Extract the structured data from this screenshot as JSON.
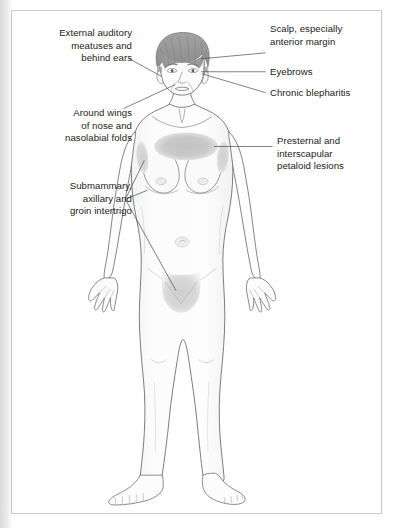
{
  "figure": {
    "colors": {
      "outline": "#6e6e6e",
      "skin_fill": "#fbfbfb",
      "skin_shade": "#f0f0f0",
      "hair": "#9a9a9a",
      "hair_dark": "#8a8a8a",
      "lesion": "#c9c9c9",
      "lesion_soft": "#d6d6d6",
      "leader_line": "#4a4a4a",
      "panel_border": "#c9c9c9",
      "panel_background": "#ffffff",
      "page_background": "#ffffff",
      "text": "#1b1b1b"
    }
  },
  "labels": [
    {
      "id": "external-auditory-meatuses",
      "text": "External auditory\nmeatuses and\nbehind ears",
      "align": "right",
      "side": "left",
      "region": "ears"
    },
    {
      "id": "around-wings-of-nose",
      "text": "Around wings\nof nose and\nnasolabial folds",
      "align": "right",
      "side": "left",
      "region": "nasolabial folds"
    },
    {
      "id": "submammary-axillary-groin",
      "text": "Submammary,\naxillary and\ngroin intertrigo",
      "align": "right",
      "side": "left",
      "region": "submammary, axillary, groin"
    },
    {
      "id": "scalp-anterior-margin",
      "text": "Scalp, especially\nanterior margin",
      "align": "left",
      "side": "right",
      "region": "scalp"
    },
    {
      "id": "eyebrows",
      "text": "Eyebrows",
      "align": "left",
      "side": "right",
      "region": "eyebrows"
    },
    {
      "id": "chronic-blepharitis",
      "text": "Chronic blepharitis",
      "align": "left",
      "side": "right",
      "region": "eyelid margins"
    },
    {
      "id": "presternal-interscapular",
      "text": "Presternal and\ninterscapular\npetaloid lesions",
      "align": "left",
      "side": "right",
      "region": "presternal chest"
    }
  ],
  "lesions": [
    {
      "id": "presternal-lesion",
      "name": "presternal petaloid lesion",
      "shape": "ellipse"
    },
    {
      "id": "axillary-lesion-left",
      "name": "left axillary intertrigo",
      "shape": "ellipse"
    },
    {
      "id": "axillary-lesion-right",
      "name": "right axillary intertrigo",
      "shape": "ellipse"
    },
    {
      "id": "groin-lesion",
      "name": "groin intertrigo",
      "shape": "shield"
    }
  ]
}
